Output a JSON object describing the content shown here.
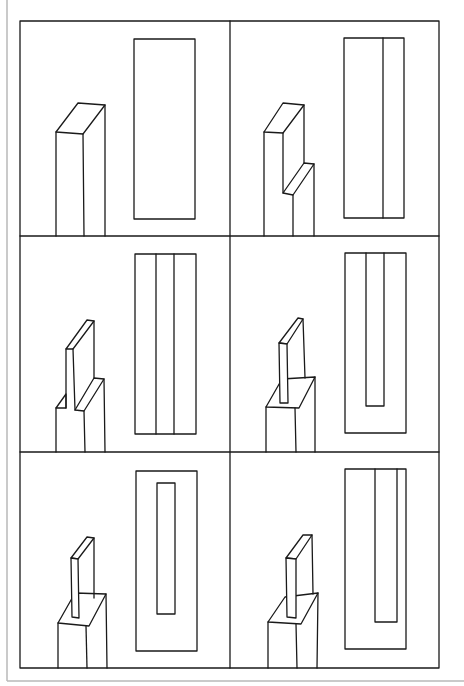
{
  "figure": {
    "title": "",
    "description": "Six-panel line drawing: each panel shows an isometric block (left) and its plan-view outline (right), illustrating progressive stages of cutting a fin/slot from a rectangular post.",
    "layout": {
      "rows": 3,
      "cols": 2
    },
    "colors": {
      "line": "#1a1a1a",
      "background": "#ffffff",
      "page_edge": "#b8b8b8"
    },
    "panels": [
      {
        "index": 1,
        "label": "panel-1",
        "block": "plain rectangular post",
        "plan": "single rectangle"
      },
      {
        "index": 2,
        "label": "panel-2",
        "block": "post with one side cut down, leaving a fin",
        "plan": "rectangle divided by one vertical line"
      },
      {
        "index": 3,
        "label": "panel-3",
        "block": "post with both sides cut down, leaving a central fin",
        "plan": "rectangle divided into three vertical strips"
      },
      {
        "index": 4,
        "label": "panel-4",
        "block": "fin on top of a shouldered base (cut from three sides)",
        "plan": "rectangle with inner U-shaped slot open at top"
      },
      {
        "index": 5,
        "label": "panel-5",
        "block": "fin centered on top of a base (cut all around)",
        "plan": "rectangle with inner closed rectangle"
      },
      {
        "index": 6,
        "label": "panel-6",
        "block": "fin on top of a base, offset to one side",
        "plan": "rectangle with inner U-shape offset right, open at top"
      }
    ]
  }
}
